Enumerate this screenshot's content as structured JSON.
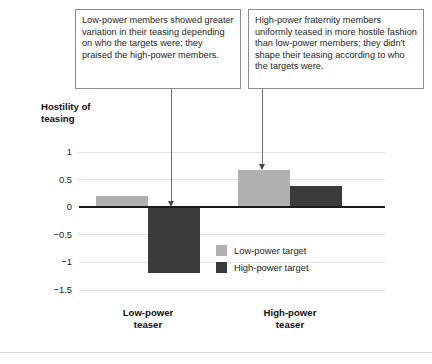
{
  "figure": {
    "axis_title": "Hostility of\nteasing",
    "callouts": [
      {
        "id": "left",
        "text": "Low-power members showed greater variation in their teasing depending on who the targets were; they praised the high-power members."
      },
      {
        "id": "right",
        "text": "High-power fraternity members uniformly teased in more hostile fashion than low-power members; they didn't shape their teasing according to who the targets were."
      }
    ]
  },
  "chart_data": {
    "type": "bar",
    "title": "",
    "xlabel": "",
    "ylabel": "Hostility of teasing",
    "categories": [
      "Low-power\nteaser",
      "High-power\nteaser"
    ],
    "series": [
      {
        "name": "Low-power target",
        "color": "#b0b0b0",
        "values": [
          0.21,
          0.67
        ]
      },
      {
        "name": "High-power target",
        "color": "#3b3b3b",
        "values": [
          -1.2,
          0.38
        ]
      }
    ],
    "ylim": [
      -1.5,
      1
    ],
    "yticks": [
      1,
      0.5,
      0,
      -0.5,
      -1,
      -1.5
    ],
    "ytick_labels": [
      "1",
      "0.5",
      "0",
      "-0.5",
      "-1",
      "-1.5"
    ],
    "grid": true,
    "legend_position": "center-right",
    "annotations": [
      {
        "text": "arrow-to-low-power-high-target-bar",
        "target_series": "High-power target",
        "target_category": "Low-power\nteaser"
      },
      {
        "text": "arrow-to-high-power-low-target-bar",
        "target_series": "Low-power target",
        "target_category": "High-power\nteaser"
      }
    ]
  }
}
